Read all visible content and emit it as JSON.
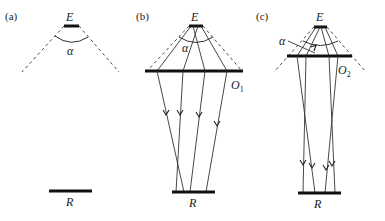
{
  "figure": {
    "panels": [
      {
        "id": "a",
        "label": "(a)",
        "source_label": "E",
        "angle_label": "α",
        "receiver_label": "R"
      },
      {
        "id": "b",
        "label": "(b)",
        "source_label": "E",
        "angle_label": "α",
        "optic_label": "O",
        "optic_subscript": "1",
        "receiver_label": "R"
      },
      {
        "id": "c",
        "label": "(c)",
        "source_label": "E",
        "angle_label": "α",
        "optic_label": "O",
        "optic_subscript": "2",
        "receiver_label": "R"
      }
    ],
    "colors": {
      "background": "#ffffff",
      "ink": "#111111"
    }
  }
}
